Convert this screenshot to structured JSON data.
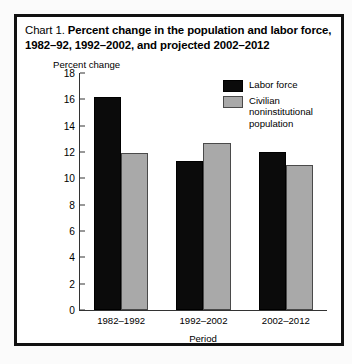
{
  "title": {
    "prefix": "Chart 1.",
    "text": "Percent change in the population and labor force, 1982–92, 1992–2002, and projected 2002–2012"
  },
  "chart_data": {
    "type": "bar",
    "title": "Chart 1. Percent change in the population and labor force, 1982–92, 1992–2002, and projected 2002–2012",
    "xlabel": "Period",
    "ylabel": "Percent change",
    "ylim": [
      0,
      18
    ],
    "ytick_step": 2,
    "yticks": [
      18,
      16,
      14,
      12,
      10,
      8,
      6,
      4,
      2,
      0
    ],
    "grid": false,
    "legend_position": "upper-right-inside",
    "categories": [
      "1982–1992",
      "1992–2002",
      "2002–2012"
    ],
    "series": [
      {
        "name": "Labor force",
        "color": "#0b0b0b",
        "values": [
          16.2,
          11.3,
          12.0
        ]
      },
      {
        "name": "Civilian noninstitutional population",
        "color": "#a9a9a9",
        "values": [
          11.9,
          12.7,
          11.0
        ]
      }
    ]
  }
}
